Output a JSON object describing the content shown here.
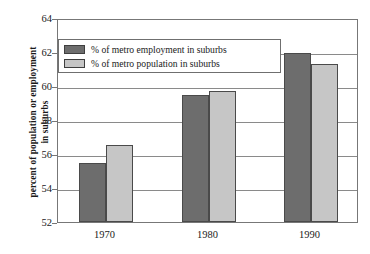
{
  "chart_data": {
    "type": "bar",
    "title": "",
    "xlabel": "",
    "ylabel": "percent of population or employment\nin suburbs",
    "categories": [
      "1970",
      "1980",
      "1990"
    ],
    "series": [
      {
        "name": "% of metro employment in suburbs",
        "color": "#6d6d6d",
        "values": [
          55.5,
          59.45,
          61.95
        ]
      },
      {
        "name": "% of metro population in suburbs",
        "color": "#c6c6c6",
        "values": [
          56.55,
          59.7,
          61.3
        ]
      }
    ],
    "ylim": [
      52,
      64
    ],
    "yticks": [
      52,
      54,
      56,
      58,
      60,
      62,
      64
    ],
    "ytick_labels": [
      "52",
      "54",
      "56",
      "58",
      "60",
      "62",
      "64"
    ],
    "grid": true,
    "legend_position": "upper left"
  },
  "legend": {
    "entries": [
      {
        "label": "% of metro employment in suburbs"
      },
      {
        "label": "% of metro population in suburbs"
      }
    ]
  },
  "colors": {
    "series_dark": "#6d6d6d",
    "series_light": "#c6c6c6",
    "grid": "#8a8a8a",
    "axis": "#777777",
    "background": "#ffffff"
  }
}
